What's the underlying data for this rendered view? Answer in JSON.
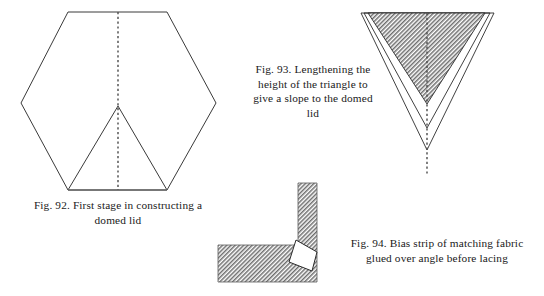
{
  "page": {
    "width": 544,
    "height": 296,
    "background": "#ffffff",
    "kind": "book-figure-plate"
  },
  "colors": {
    "ink": "#2b2b2b",
    "line": "#3a3a3a",
    "base_line": "#6b6b6b",
    "dashed_line": "#4a4a4a",
    "hatch": "#808080",
    "paper": "#ffffff"
  },
  "figures": [
    {
      "id": "fig-92",
      "number": "Fig. 92.",
      "caption": "Fig. 92.  First stage in constructing a domed lid",
      "caption_lines": [
        "Fig. 92.  First stage in constructing a",
        "domed lid"
      ],
      "description": "Regular hexagon outline with an inner triangle rising from the bottom edge to the hexagon centre, and a vertical dashed centre line",
      "shapes": [
        {
          "name": "hexagon-outline",
          "type": "polygon",
          "points": "68,12 167,12 216,103 167,190 68,190 21,103"
        },
        {
          "name": "inner-triangle",
          "type": "polyline",
          "points": "68,190 118,106 167,190"
        },
        {
          "name": "bottom-base-edge",
          "type": "line",
          "points": "68,190 167,190"
        },
        {
          "name": "centre-dashed-line",
          "type": "line",
          "points": "118,12 118,190",
          "style": "dashed"
        }
      ]
    },
    {
      "id": "fig-93",
      "number": "Fig. 93.",
      "caption": "Fig. 93. Lengthening the height of the triangle to give a slope to the domed lid",
      "caption_lines": [
        "Fig. 93. Lengthening the",
        "height of the triangle to",
        "give a slope to the domed",
        "lid"
      ],
      "description": "Shaded inverted triangle with two progressively longer nested V outlines below it and a vertical dashed centre line",
      "shapes": [
        {
          "name": "shaded-triangle",
          "type": "polygon",
          "points": "368,13 485,13 427,104",
          "fill": "hatch"
        },
        {
          "name": "nested-v-1",
          "type": "polyline",
          "points": "364,13 427,128 490,13"
        },
        {
          "name": "nested-v-2",
          "type": "polyline",
          "points": "361,13 427,150 494,13"
        },
        {
          "name": "centre-dashed-line",
          "type": "line",
          "points": "427,13 427,176",
          "style": "dashed"
        }
      ]
    },
    {
      "id": "fig-94",
      "number": "Fig. 94.",
      "caption": "Fig. 94.  Bias strip of matching fabric glued over angle before lacing",
      "caption_lines": [
        "Fig. 94.  Bias strip of matching fabric",
        "glued over angle before lacing"
      ],
      "description": "L-shaped hatched fabric corner with a white quadrilateral bias-strip notch at the inner angle",
      "shapes": [
        {
          "name": "l-shaped-hatched-body",
          "type": "polygon",
          "points": "298,183 317,183 317,282 218,282 218,245 298,245",
          "fill": "hatch"
        },
        {
          "name": "bias-strip-notch",
          "type": "polygon",
          "points": "296,240 317,252 312,271 289,262",
          "fill": "white"
        }
      ]
    }
  ]
}
